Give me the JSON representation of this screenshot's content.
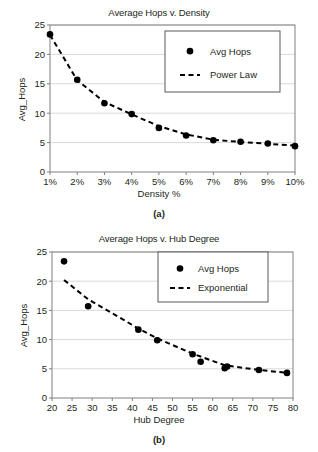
{
  "figures": [
    {
      "id": "a",
      "caption": "(a)",
      "chart_data": {
        "type": "scatter",
        "title": "Average Hops v. Density",
        "xlabel": "Density %",
        "ylabel": "Avg_Hops",
        "xlim": [
          1,
          10
        ],
        "ylim": [
          0,
          25
        ],
        "xticks": [
          "1%",
          "2%",
          "3%",
          "4%",
          "5%",
          "6%",
          "7%",
          "8%",
          "9%",
          "10%"
        ],
        "xtickvalues": [
          1,
          2,
          3,
          4,
          5,
          6,
          7,
          8,
          9,
          10
        ],
        "yticks": [
          "0",
          "5",
          "10",
          "15",
          "20",
          "25"
        ],
        "ytickvalues": [
          0,
          5,
          10,
          15,
          20,
          25
        ],
        "grid": "horizontal",
        "legend_position": "upper-right",
        "series": [
          {
            "name": "Avg Hops",
            "style": "marker",
            "x": [
              1,
              2,
              3,
              4,
              5,
              6,
              7,
              8,
              9,
              10
            ],
            "values": [
              23.4,
              15.7,
              11.7,
              9.85,
              7.5,
              6.2,
              5.4,
              5.15,
              4.85,
              4.4
            ]
          },
          {
            "name": "Power Law",
            "style": "dashed-line",
            "x": [
              1,
              2,
              3,
              4,
              5,
              6,
              7,
              8,
              9,
              10
            ],
            "values": [
              23.3,
              15.6,
              11.9,
              9.8,
              7.8,
              6.4,
              5.5,
              5.1,
              4.8,
              4.5
            ]
          }
        ]
      }
    },
    {
      "id": "b",
      "caption": "(b)",
      "chart_data": {
        "type": "scatter",
        "title": "Average Hops v. Hub Degree",
        "xlabel": "Hub Degree",
        "ylabel": "Avg_Hops",
        "xlim": [
          20,
          80
        ],
        "ylim": [
          0,
          25
        ],
        "xticks": [
          "20",
          "25",
          "30",
          "35",
          "40",
          "45",
          "50",
          "55",
          "60",
          "65",
          "70",
          "75",
          "80"
        ],
        "xtickvalues": [
          20,
          25,
          30,
          35,
          40,
          45,
          50,
          55,
          60,
          65,
          70,
          75,
          80
        ],
        "yticks": [
          "0",
          "5",
          "10",
          "15",
          "20",
          "25"
        ],
        "ytickvalues": [
          0,
          5,
          10,
          15,
          20,
          25
        ],
        "grid": "horizontal",
        "legend_position": "upper-right",
        "series": [
          {
            "name": "Avg Hops",
            "style": "marker",
            "x": [
              23.0,
              29.0,
              41.5,
              46.2,
              55.0,
              57.0,
              63.0,
              63.6,
              71.5,
              78.5
            ],
            "values": [
              23.4,
              15.7,
              11.7,
              9.9,
              7.5,
              6.2,
              5.1,
              5.4,
              4.8,
              4.3
            ]
          },
          {
            "name": "Exponential",
            "style": "dashed-line",
            "x": [
              23.0,
              29.0,
              41.5,
              46.2,
              55.0,
              57.0,
              63.0,
              71.5,
              78.5
            ],
            "values": [
              20.2,
              16.9,
              11.9,
              10.2,
              7.6,
              7.1,
              5.6,
              4.8,
              4.3
            ]
          }
        ]
      }
    }
  ],
  "colors": {
    "ink": "#231f20",
    "axis": "#808080",
    "grid": "#d9d9d9",
    "marker": "#000000"
  }
}
